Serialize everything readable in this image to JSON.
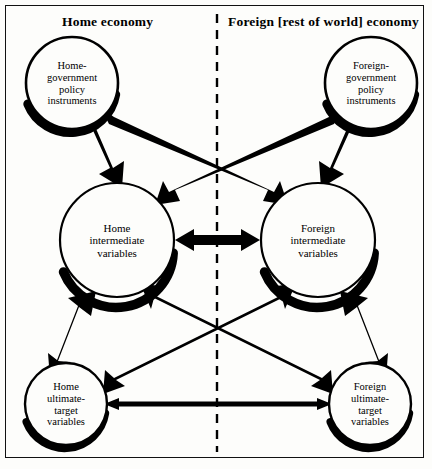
{
  "figure": {
    "type": "diagram",
    "style": "policy-interdependence-flow-chart",
    "background_color": "#fdfdfb",
    "ink_color": "#000000",
    "panels": [
      {
        "id": "home",
        "title": "Home economy"
      },
      {
        "id": "foreign",
        "title": "Foreign [rest of world] economy"
      }
    ],
    "divider": {
      "name": "economy-divider",
      "orientation": "vertical",
      "style": "dashed",
      "x": 217
    }
  },
  "nodes": [
    {
      "id": "home-policy",
      "label": "Home-\ngovernment\npolicy\ninstruments",
      "cx": 72,
      "cy": 83,
      "r": 46,
      "side": "home",
      "tier": "policy-instruments"
    },
    {
      "id": "foreign-policy",
      "label": "Foreign-\ngovernment\npolicy\ninstruments",
      "cx": 371,
      "cy": 83,
      "r": 46,
      "side": "foreign",
      "tier": "policy-instruments"
    },
    {
      "id": "home-intermediate",
      "label": "Home\nintermediate\nvariables",
      "cx": 117,
      "cy": 240,
      "r": 57,
      "side": "home",
      "tier": "intermediate-variables"
    },
    {
      "id": "foreign-intermediate",
      "label": "Foreign\nintermediate\nvariables",
      "cx": 318,
      "cy": 240,
      "r": 57,
      "side": "foreign",
      "tier": "intermediate-variables"
    },
    {
      "id": "home-ultimate",
      "label": "Home\nultimate-\ntarget\nvariables",
      "cx": 66,
      "cy": 404,
      "r": 41,
      "side": "home",
      "tier": "ultimate-target-variables"
    },
    {
      "id": "foreign-ultimate",
      "label": "Foreign\nultimate-\ntarget\nvariables",
      "cx": 370,
      "cy": 404,
      "r": 41,
      "side": "foreign",
      "tier": "ultimate-target-variables"
    }
  ],
  "edges": [
    {
      "id": "home-policy-to-home-intermediate",
      "from": "home-policy",
      "to": "home-intermediate",
      "heads": "single",
      "weight": "thick"
    },
    {
      "id": "home-policy-to-foreign-intermediate",
      "from": "home-policy",
      "to": "foreign-intermediate",
      "heads": "single",
      "weight": "thick"
    },
    {
      "id": "foreign-policy-to-foreign-intermediate",
      "from": "foreign-policy",
      "to": "foreign-intermediate",
      "heads": "single",
      "weight": "thick"
    },
    {
      "id": "foreign-policy-to-home-intermediate",
      "from": "foreign-policy",
      "to": "home-intermediate",
      "heads": "single",
      "weight": "thick"
    },
    {
      "id": "home-intermediate-to-foreign-intermediate",
      "from": "home-intermediate",
      "to": "foreign-intermediate",
      "heads": "double",
      "weight": "thick"
    },
    {
      "id": "home-intermediate-to-home-ultimate",
      "from": "home-intermediate",
      "to": "home-ultimate",
      "heads": "double",
      "weight": "thick"
    },
    {
      "id": "foreign-intermediate-to-foreign-ultimate",
      "from": "foreign-intermediate",
      "to": "foreign-ultimate",
      "heads": "double",
      "weight": "thick"
    },
    {
      "id": "home-intermediate-to-foreign-ultimate",
      "from": "home-intermediate",
      "to": "foreign-ultimate",
      "heads": "double",
      "weight": "medium"
    },
    {
      "id": "foreign-intermediate-to-home-ultimate",
      "from": "foreign-intermediate",
      "to": "home-ultimate",
      "heads": "double",
      "weight": "medium"
    },
    {
      "id": "home-ultimate-to-foreign-ultimate",
      "from": "home-ultimate",
      "to": "foreign-ultimate",
      "heads": "double",
      "weight": "thin"
    }
  ]
}
